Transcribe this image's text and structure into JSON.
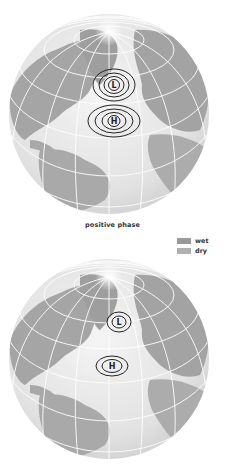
{
  "figure": {
    "label": "positive phase",
    "legend": [
      {
        "label": "wet",
        "color": "#9a9a9a"
      },
      {
        "label": "dry",
        "color": "#b0b0b0"
      }
    ],
    "colors": {
      "ocean": "#ececec",
      "land": "#a8a8a8",
      "land_dark": "#9a9a9a",
      "grid": "#ffffff",
      "isobar": "#222222"
    },
    "panels": [
      {
        "name": "positive-phase",
        "low": {
          "symbol": "L",
          "rings": 4
        },
        "high": {
          "symbol": "H",
          "rings": 4
        }
      },
      {
        "name": "negative-phase",
        "low": {
          "symbol": "L",
          "rings": 2
        },
        "high": {
          "symbol": "H",
          "rings": 2
        }
      }
    ]
  }
}
